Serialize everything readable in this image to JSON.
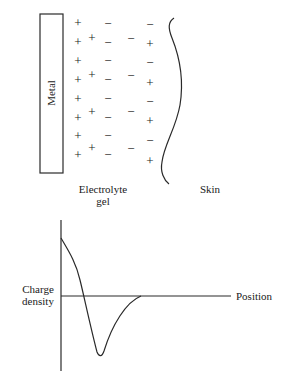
{
  "top_diagram": {
    "metal_label": "Metal",
    "gel_label_line1": "Electrolyte",
    "gel_label_line2": "gel",
    "skin_label": "Skin",
    "columns": [
      {
        "name": "metal-surface-positive",
        "signs": [
          "+",
          "+",
          "+",
          "+",
          "+",
          "+",
          "+",
          "+"
        ]
      },
      {
        "name": "gel-positive",
        "signs": [
          "+",
          "+",
          "+",
          "+"
        ]
      },
      {
        "name": "gel-negative-inner",
        "signs": [
          "−",
          "−",
          "−",
          "−",
          "−",
          "−",
          "−",
          "−"
        ]
      },
      {
        "name": "gel-negative-outer",
        "signs": [
          "−",
          "−",
          "−",
          "−"
        ]
      },
      {
        "name": "skin-boundary",
        "signs": [
          "−",
          "+",
          "−",
          "+",
          "−",
          "+",
          "−",
          "+"
        ]
      }
    ]
  },
  "graph": {
    "y_label_line1": "Charge",
    "y_label_line2": "density",
    "x_label": "Position",
    "curve_description": "Positive at metal surface, crosses zero, dips to negative minimum, returns to zero"
  }
}
